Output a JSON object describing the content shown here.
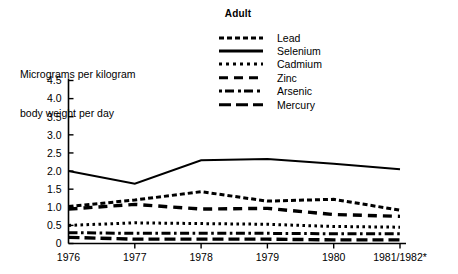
{
  "chart_data": {
    "type": "line",
    "title": "Adult",
    "ylabel": "Micrograms per kilogram\nbody weight per day",
    "ylabel_line1": "Micrograms per kilogram",
    "ylabel_line2": "body weight per day",
    "xlabel": "",
    "categories": [
      "1976",
      "1977",
      "1978",
      "1979",
      "1980",
      "1981/1982*"
    ],
    "yticks": [
      "4.5",
      "4.0",
      "3.5",
      "3.0",
      "2.5",
      "2.0",
      "1.5",
      "1.0",
      "0.5",
      "0"
    ],
    "ytick_values": [
      4.5,
      4.0,
      3.5,
      3.0,
      2.5,
      2.0,
      1.5,
      1.0,
      0.5,
      0
    ],
    "ylim": [
      0,
      4.5
    ],
    "grid": false,
    "legend_position": "top-center",
    "axis_color": "#000000",
    "series": [
      {
        "name": "Lead",
        "style": "dash-dot",
        "color": "#000000",
        "values": [
          1.02,
          1.2,
          1.43,
          1.17,
          1.22,
          0.92
        ]
      },
      {
        "name": "Selenium",
        "style": "solid",
        "color": "#000000",
        "values": [
          2.0,
          1.65,
          2.3,
          2.33,
          2.2,
          2.05
        ]
      },
      {
        "name": "Cadmium",
        "style": "dotted",
        "color": "#000000",
        "values": [
          0.5,
          0.57,
          0.55,
          0.53,
          0.47,
          0.45
        ]
      },
      {
        "name": "Zinc",
        "style": "dashed",
        "color": "#000000",
        "values": [
          0.95,
          1.08,
          0.95,
          0.97,
          0.8,
          0.75
        ]
      },
      {
        "name": "Arsenic",
        "style": "dash-dot-short",
        "color": "#000000",
        "values": [
          0.3,
          0.28,
          0.28,
          0.28,
          0.27,
          0.27
        ]
      },
      {
        "name": "Mercury",
        "style": "long-dash",
        "color": "#000000",
        "values": [
          0.17,
          0.12,
          0.12,
          0.12,
          0.1,
          0.1
        ]
      }
    ]
  }
}
